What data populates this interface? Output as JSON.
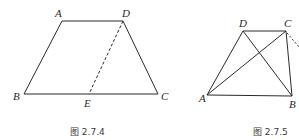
{
  "figures": [
    {
      "caption": "图 2.7.4",
      "shape": "trapezoid",
      "labels": {
        "A": "A",
        "D": "D",
        "B": "B",
        "C": "C",
        "E": "E"
      },
      "points": {
        "A": [
          62,
          21
        ],
        "D": [
          123,
          21
        ],
        "B": [
          24,
          94
        ],
        "C": [
          158,
          94
        ],
        "E": [
          89,
          94
        ]
      },
      "solid_segments": [
        "AD",
        "AB",
        "BC",
        "DC"
      ],
      "dashed_segments": [
        "DE"
      ]
    },
    {
      "caption": "图 2.7.5",
      "shape": "trapezoid with diagonals",
      "labels": {
        "D": "D",
        "C": "C",
        "A": "A",
        "B": "B"
      },
      "points": {
        "D": [
          243,
          31
        ],
        "C": [
          286,
          31
        ],
        "A": [
          207,
          95
        ],
        "B": [
          292,
          96
        ]
      },
      "solid_segments": [
        "DC",
        "AD",
        "AB",
        "CB",
        "AC",
        "DB"
      ],
      "dashed_segments": [
        "C-extension"
      ]
    }
  ]
}
